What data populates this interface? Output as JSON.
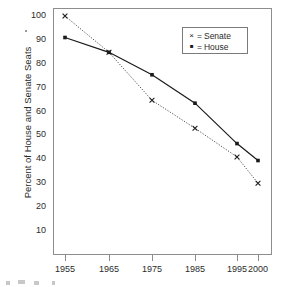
{
  "chart_data": {
    "type": "line",
    "title": "",
    "xlabel": "",
    "ylabel": "Percent of House and Senate Seats",
    "x": [
      1955,
      1965,
      1975,
      1985,
      1995,
      2000
    ],
    "xticklabels": [
      "1955",
      "1965",
      "1975",
      "1985",
      "1995",
      "2000"
    ],
    "yticks": [
      10,
      20,
      30,
      40,
      50,
      60,
      70,
      80,
      90,
      100
    ],
    "yticklabels": [
      "10",
      "20",
      "30",
      "40",
      "50",
      "60",
      "70",
      "80",
      "90",
      "100"
    ],
    "ylim": [
      0,
      104
    ],
    "xlim": [
      1952.5,
      2001.5
    ],
    "grid": false,
    "legend_position": "top-right",
    "series": [
      {
        "name": "Senate",
        "legend_label": "= Senate",
        "marker": "x",
        "marker_glyph": "×",
        "linestyle": "dotted",
        "color": "#4d4d4d",
        "values": [
          100,
          84.8,
          64.7,
          53.0,
          41.0,
          30.0
        ]
      },
      {
        "name": "House",
        "legend_label": "= House",
        "marker": "square",
        "marker_glyph": "▪",
        "linestyle": "solid",
        "color": "#1a1a1a",
        "values": [
          91.0,
          84.8,
          75.4,
          63.5,
          46.6,
          39.5
        ]
      }
    ]
  },
  "axes": {
    "y_title": "Percent of House and Senate Seats",
    "tick_color": "#8d8d8d",
    "label_color": "#2b2b2b",
    "frame_color": "#8d8d8d"
  },
  "legend": {
    "box_border_color": "#7a7a7a",
    "entries": [
      {
        "glyph": "×",
        "equals": "=",
        "label": "Senate"
      },
      {
        "glyph": "▪",
        "equals": "=",
        "label": "House"
      }
    ]
  }
}
